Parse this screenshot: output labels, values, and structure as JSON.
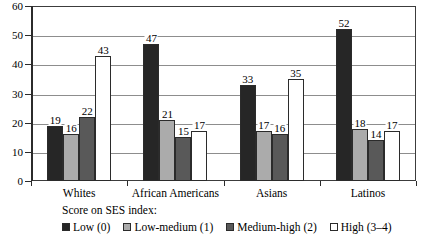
{
  "chart_data": {
    "type": "bar",
    "title": "",
    "subtitle": "",
    "xlabel": "",
    "ylabel": "",
    "ylim": [
      0,
      60
    ],
    "yticks": [
      0,
      10,
      20,
      30,
      40,
      50,
      60
    ],
    "grid": true,
    "legend_position": "bottom",
    "legend_title": "Score on SES index:",
    "categories": [
      "Whites",
      "African Americans",
      "Asians",
      "Latinos"
    ],
    "series": [
      {
        "name": "Low (0)",
        "color": "#262626",
        "values": [
          19,
          47,
          33,
          52
        ]
      },
      {
        "name": "Low-medium (1)",
        "color": "#ababab",
        "values": [
          16,
          21,
          17,
          18
        ]
      },
      {
        "name": "Medium-high (2)",
        "color": "#595959",
        "values": [
          22,
          15,
          16,
          14
        ]
      },
      {
        "name": "High (3–4)",
        "color": "#ffffff",
        "values": [
          43,
          17,
          35,
          17
        ]
      }
    ]
  },
  "axis": {
    "y_tick_labels": [
      "0",
      "10",
      "20",
      "30",
      "40",
      "50",
      "60"
    ]
  },
  "colors": {
    "axis": "#2b2b2b",
    "grid": "#8d8d8d",
    "frame": "#3c3c3c",
    "background": "#ffffff"
  }
}
